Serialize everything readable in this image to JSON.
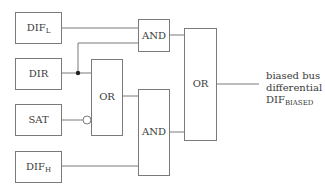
{
  "inputs": [
    {
      "id": "dif_l",
      "main": "DIF",
      "sub": "L"
    },
    {
      "id": "dir",
      "main": "DIR",
      "sub": ""
    },
    {
      "id": "sat",
      "main": "SAT",
      "sub": ""
    },
    {
      "id": "dif_h",
      "main": "DIF",
      "sub": "H"
    }
  ],
  "gates": {
    "and_top": "AND",
    "or_mid": "OR",
    "and_bottom": "AND",
    "or_final": "OR"
  },
  "output": {
    "line1": "biased bus",
    "line2": "differential",
    "line3_main": "DIF",
    "line3_sub": "BIASED"
  },
  "colors": {
    "stroke": "#7a7a7a",
    "text": "#3a3a3a",
    "background": "#ffffff"
  }
}
